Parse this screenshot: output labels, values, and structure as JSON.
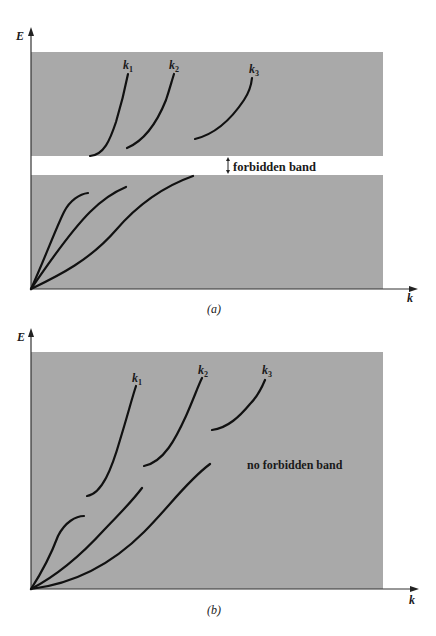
{
  "figure": {
    "band_color": "#a9a9a9",
    "curve_color": "#111111",
    "panels": [
      {
        "id": "a",
        "caption": "(a)",
        "y_axis_label": "E",
        "x_axis_label": "k",
        "curve_labels": [
          "k",
          "k",
          "k"
        ],
        "curve_label_subscripts": [
          "1",
          "2",
          "3"
        ],
        "gap_label": "forbidden band",
        "description": "Two allowed energy bands separated by a white forbidden band gap"
      },
      {
        "id": "b",
        "caption": "(b)",
        "y_axis_label": "E",
        "x_axis_label": "k",
        "curve_labels": [
          "k",
          "k",
          "k"
        ],
        "curve_label_subscripts": [
          "1",
          "2",
          "3"
        ],
        "region_label": "no forbidden band",
        "description": "Overlapping bands with no forbidden band gap"
      }
    ]
  }
}
